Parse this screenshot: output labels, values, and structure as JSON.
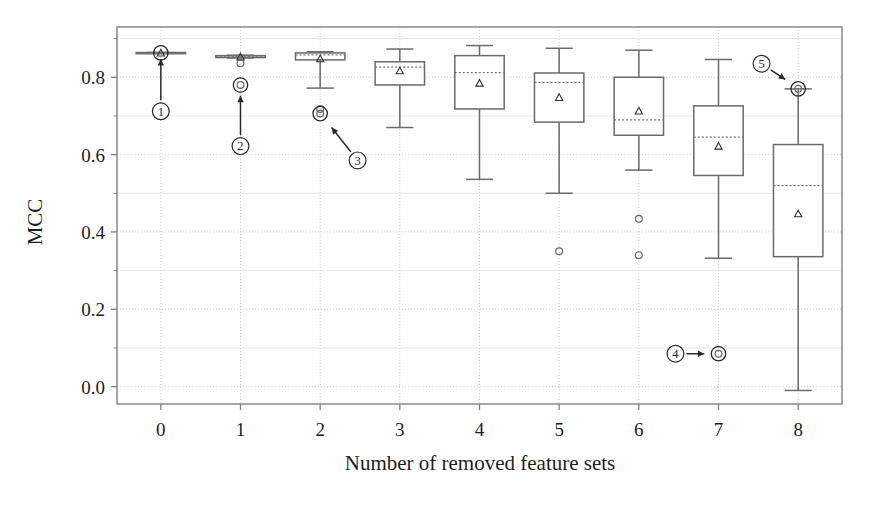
{
  "figure": {
    "background": "#ffffff",
    "frame_color": "#808080",
    "grid_color": "#cccccc",
    "box_color": "#6a6a6a",
    "median_color": "#777777",
    "mean_marker_color": "#333333",
    "outlier_color": "#666666",
    "annotation_color": "#2a2a2a"
  },
  "chart_data": {
    "type": "box",
    "title": "",
    "xlabel": "Number of removed feature sets",
    "ylabel": "MCC",
    "categories": [
      "0",
      "1",
      "2",
      "3",
      "4",
      "5",
      "6",
      "7",
      "8"
    ],
    "xlim": [
      -0.55,
      8.55
    ],
    "ylim": [
      -0.045,
      0.93
    ],
    "yticks": [
      0.0,
      0.2,
      0.4,
      0.6,
      0.8
    ],
    "ytick_labels": [
      "0.0",
      "0.2",
      "0.4",
      "0.6",
      "0.8"
    ],
    "yticks_minor": [
      0.1,
      0.3,
      0.5,
      0.7,
      0.9
    ],
    "grid": true,
    "legend": "none",
    "boxes": [
      {
        "category": "0",
        "x": 0,
        "whisker_low": 0.862,
        "q1": 0.862,
        "median": 0.862,
        "q3": 0.864,
        "whisker_high": 0.864,
        "mean": 0.863,
        "outliers": [],
        "width": 0.62
      },
      {
        "category": "1",
        "x": 1,
        "whisker_low": 0.85,
        "q1": 0.851,
        "median": 0.854,
        "q3": 0.856,
        "whisker_high": 0.857,
        "mean": 0.853,
        "outliers": [
          0.836,
          0.78
        ],
        "width": 0.62
      },
      {
        "category": "2",
        "x": 2,
        "whisker_low": 0.772,
        "q1": 0.845,
        "median": 0.858,
        "q3": 0.863,
        "whisker_high": 0.866,
        "mean": 0.848,
        "outliers": [
          0.718,
          0.706
        ],
        "width": 0.62
      },
      {
        "category": "3",
        "x": 3,
        "whisker_low": 0.67,
        "q1": 0.78,
        "median": 0.826,
        "q3": 0.84,
        "whisker_high": 0.873,
        "mean": 0.817,
        "outliers": [],
        "width": 0.62
      },
      {
        "category": "4",
        "x": 4,
        "whisker_low": 0.536,
        "q1": 0.718,
        "median": 0.812,
        "q3": 0.856,
        "whisker_high": 0.882,
        "mean": 0.785,
        "outliers": [],
        "width": 0.62
      },
      {
        "category": "5",
        "x": 5,
        "whisker_low": 0.5,
        "q1": 0.684,
        "median": 0.787,
        "q3": 0.811,
        "whisker_high": 0.875,
        "mean": 0.748,
        "outliers": [
          0.35
        ],
        "width": 0.62
      },
      {
        "category": "6",
        "x": 6,
        "whisker_low": 0.56,
        "q1": 0.65,
        "median": 0.69,
        "q3": 0.8,
        "whisker_high": 0.87,
        "mean": 0.713,
        "outliers": [
          0.434,
          0.34
        ],
        "width": 0.62
      },
      {
        "category": "7",
        "x": 7,
        "whisker_low": 0.332,
        "q1": 0.546,
        "median": 0.645,
        "q3": 0.726,
        "whisker_high": 0.846,
        "mean": 0.622,
        "outliers": [
          0.085
        ],
        "width": 0.62
      },
      {
        "category": "8",
        "x": 8,
        "whisker_low": -0.01,
        "q1": 0.336,
        "median": 0.52,
        "q3": 0.626,
        "whisker_high": 0.77,
        "mean": 0.447,
        "outliers": [
          0.77
        ],
        "width": 0.62
      }
    ],
    "annotations": [
      {
        "id": "1",
        "label": "①",
        "marker_x": 0,
        "marker_y": 0.712,
        "target_x": 0,
        "target_y": 0.855,
        "arrow": "up",
        "highlight_x": 0,
        "highlight_y": 0.863
      },
      {
        "id": "2",
        "label": "②",
        "marker_x": 1,
        "marker_y": 0.622,
        "target_x": 1,
        "target_y": 0.76,
        "arrow": "up",
        "highlight_x": 1,
        "highlight_y": 0.78
      },
      {
        "id": "3",
        "label": "③",
        "marker_x": 2.47,
        "marker_y": 0.585,
        "target_x": 2.12,
        "target_y": 0.676,
        "arrow": "diagonal-up-left",
        "highlight_x": 2,
        "highlight_y": 0.706
      },
      {
        "id": "4",
        "label": "④",
        "marker_x": 6.46,
        "marker_y": 0.085,
        "target_x": 6.86,
        "target_y": 0.085,
        "arrow": "right",
        "highlight_x": 7,
        "highlight_y": 0.085
      },
      {
        "id": "5",
        "label": "⑤",
        "marker_x": 7.54,
        "marker_y": 0.835,
        "target_x": 7.87,
        "target_y": 0.79,
        "arrow": "diagonal-down-right",
        "highlight_x": 8,
        "highlight_y": 0.77
      }
    ]
  }
}
